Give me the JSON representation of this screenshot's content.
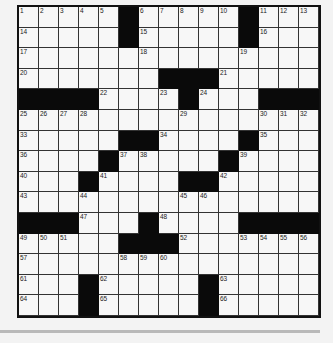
{
  "puzzle": {
    "rows": 15,
    "cols": 15,
    "black_cells": [
      [
        0,
        5
      ],
      [
        0,
        11
      ],
      [
        1,
        5
      ],
      [
        1,
        11
      ],
      [
        3,
        7
      ],
      [
        3,
        8
      ],
      [
        3,
        9
      ],
      [
        4,
        0
      ],
      [
        4,
        1
      ],
      [
        4,
        2
      ],
      [
        4,
        3
      ],
      [
        4,
        8
      ],
      [
        4,
        12
      ],
      [
        4,
        13
      ],
      [
        4,
        14
      ],
      [
        6,
        5
      ],
      [
        6,
        6
      ],
      [
        6,
        11
      ],
      [
        7,
        4
      ],
      [
        7,
        10
      ],
      [
        8,
        3
      ],
      [
        8,
        8
      ],
      [
        8,
        9
      ],
      [
        10,
        0
      ],
      [
        10,
        1
      ],
      [
        10,
        2
      ],
      [
        10,
        6
      ],
      [
        10,
        11
      ],
      [
        10,
        12
      ],
      [
        10,
        13
      ],
      [
        10,
        14
      ],
      [
        11,
        5
      ],
      [
        11,
        6
      ],
      [
        11,
        7
      ],
      [
        13,
        3
      ],
      [
        13,
        9
      ],
      [
        14,
        3
      ],
      [
        14,
        9
      ]
    ],
    "numbers": [
      {
        "r": 0,
        "c": 0,
        "n": "1"
      },
      {
        "r": 0,
        "c": 1,
        "n": "2"
      },
      {
        "r": 0,
        "c": 2,
        "n": "3"
      },
      {
        "r": 0,
        "c": 3,
        "n": "4"
      },
      {
        "r": 0,
        "c": 4,
        "n": "5"
      },
      {
        "r": 0,
        "c": 6,
        "n": "6"
      },
      {
        "r": 0,
        "c": 7,
        "n": "7"
      },
      {
        "r": 0,
        "c": 8,
        "n": "8"
      },
      {
        "r": 0,
        "c": 9,
        "n": "9"
      },
      {
        "r": 0,
        "c": 10,
        "n": "10"
      },
      {
        "r": 0,
        "c": 12,
        "n": "11"
      },
      {
        "r": 0,
        "c": 13,
        "n": "12"
      },
      {
        "r": 0,
        "c": 14,
        "n": "13"
      },
      {
        "r": 1,
        "c": 0,
        "n": "14"
      },
      {
        "r": 1,
        "c": 6,
        "n": "15"
      },
      {
        "r": 1,
        "c": 12,
        "n": "16"
      },
      {
        "r": 2,
        "c": 0,
        "n": "17"
      },
      {
        "r": 2,
        "c": 6,
        "n": "18"
      },
      {
        "r": 2,
        "c": 11,
        "n": "19"
      },
      {
        "r": 3,
        "c": 0,
        "n": "20"
      },
      {
        "r": 3,
        "c": 10,
        "n": "21"
      },
      {
        "r": 4,
        "c": 4,
        "n": "22"
      },
      {
        "r": 4,
        "c": 7,
        "n": "23"
      },
      {
        "r": 4,
        "c": 9,
        "n": "24"
      },
      {
        "r": 5,
        "c": 0,
        "n": "25"
      },
      {
        "r": 5,
        "c": 1,
        "n": "26"
      },
      {
        "r": 5,
        "c": 2,
        "n": "27"
      },
      {
        "r": 5,
        "c": 3,
        "n": "28"
      },
      {
        "r": 5,
        "c": 8,
        "n": "29"
      },
      {
        "r": 5,
        "c": 12,
        "n": "30"
      },
      {
        "r": 5,
        "c": 13,
        "n": "31"
      },
      {
        "r": 5,
        "c": 14,
        "n": "32"
      },
      {
        "r": 6,
        "c": 0,
        "n": "33"
      },
      {
        "r": 6,
        "c": 7,
        "n": "34"
      },
      {
        "r": 6,
        "c": 12,
        "n": "35"
      },
      {
        "r": 7,
        "c": 0,
        "n": "36"
      },
      {
        "r": 7,
        "c": 5,
        "n": "37"
      },
      {
        "r": 7,
        "c": 6,
        "n": "38"
      },
      {
        "r": 7,
        "c": 11,
        "n": "39"
      },
      {
        "r": 8,
        "c": 0,
        "n": "40"
      },
      {
        "r": 8,
        "c": 4,
        "n": "41"
      },
      {
        "r": 8,
        "c": 10,
        "n": "42"
      },
      {
        "r": 9,
        "c": 0,
        "n": "43"
      },
      {
        "r": 9,
        "c": 3,
        "n": "44"
      },
      {
        "r": 9,
        "c": 8,
        "n": "45"
      },
      {
        "r": 9,
        "c": 9,
        "n": "46"
      },
      {
        "r": 10,
        "c": 3,
        "n": "47"
      },
      {
        "r": 10,
        "c": 7,
        "n": "48"
      },
      {
        "r": 11,
        "c": 0,
        "n": "49"
      },
      {
        "r": 11,
        "c": 1,
        "n": "50"
      },
      {
        "r": 11,
        "c": 2,
        "n": "51"
      },
      {
        "r": 11,
        "c": 8,
        "n": "52"
      },
      {
        "r": 11,
        "c": 11,
        "n": "53"
      },
      {
        "r": 11,
        "c": 12,
        "n": "54"
      },
      {
        "r": 11,
        "c": 13,
        "n": "55"
      },
      {
        "r": 11,
        "c": 14,
        "n": "56"
      },
      {
        "r": 12,
        "c": 0,
        "n": "57"
      },
      {
        "r": 12,
        "c": 5,
        "n": "58"
      },
      {
        "r": 12,
        "c": 6,
        "n": "59"
      },
      {
        "r": 12,
        "c": 7,
        "n": "60"
      },
      {
        "r": 13,
        "c": 0,
        "n": "61"
      },
      {
        "r": 13,
        "c": 4,
        "n": "62"
      },
      {
        "r": 13,
        "c": 10,
        "n": "63"
      },
      {
        "r": 14,
        "c": 0,
        "n": "64"
      },
      {
        "r": 14,
        "c": 4,
        "n": "65"
      },
      {
        "r": 14,
        "c": 10,
        "n": "66"
      }
    ]
  },
  "colors": {
    "black_cell": "#0a0a0a",
    "white_cell": "#f7f7f7",
    "background": "#f3f3f3",
    "divider": "#b9b9b9"
  }
}
